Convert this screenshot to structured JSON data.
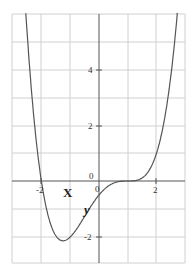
{
  "chart_data": {
    "type": "line",
    "title": "",
    "xlabel": "X",
    "ylabel": "y",
    "xlim": [
      -3,
      3
    ],
    "ylim": [
      -2.9,
      6
    ],
    "grid": true,
    "x_ticks": [
      -2,
      0,
      2
    ],
    "x_tick_labels": [
      "-2",
      "0",
      "2"
    ],
    "y_ticks": [
      -2,
      0,
      2,
      4
    ],
    "y_tick_labels": [
      "-2",
      "0",
      "2",
      "4"
    ],
    "series": [
      {
        "name": "f(x)",
        "description": "approx. y = 0.25(x+2)(x-1)^3",
        "x": [
          -2.55,
          -2.4,
          -2.2,
          -2.0,
          -1.8,
          -1.6,
          -1.4,
          -1.25,
          -1.0,
          -0.8,
          -0.6,
          -0.4,
          -0.2,
          0.0,
          0.2,
          0.4,
          0.6,
          0.8,
          1.0,
          1.2,
          1.4,
          1.6,
          1.8,
          2.0,
          2.2,
          2.4,
          2.6,
          2.72
        ],
        "y": [
          6.15,
          4.59,
          2.9,
          0.0,
          -1.25,
          -1.92,
          -2.13,
          -2.14,
          -2.0,
          -1.83,
          -1.64,
          -1.41,
          -1.15,
          -0.5,
          -0.28,
          -0.13,
          -0.05,
          -0.01,
          0.0,
          0.01,
          0.05,
          0.18,
          0.49,
          1.0,
          1.81,
          2.99,
          4.71,
          6.0
        ]
      }
    ],
    "line_color": "#555555",
    "grid_color": "#d0d0d0",
    "axis_color": "#555555"
  },
  "labels": {
    "x_axis": "X",
    "y_axis": "y",
    "origin_upper": "0",
    "origin_lower": "0"
  },
  "ticks": {
    "x_neg2": "-2",
    "x_2": "2",
    "y_4": "4",
    "y_2": "2",
    "y_neg2": "-2"
  }
}
